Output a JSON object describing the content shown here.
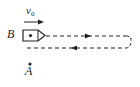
{
  "diagram": {
    "labels": {
      "velocity": "v",
      "velocity_subscript": "0",
      "point_B": "B",
      "point_A": "A"
    },
    "elements": {
      "velocity_arrow": {
        "direction": "right"
      },
      "object_at_B": {
        "shape": "box-with-pointed-front",
        "marker": "dot"
      },
      "path": {
        "style": "dashed",
        "outgoing_direction": "right",
        "return_direction": "left",
        "turnaround": "curved-right-end"
      },
      "point_A_marker": {
        "shape": "dot"
      }
    },
    "colors": {
      "stroke": "#222222",
      "background": "#ffffff"
    }
  }
}
